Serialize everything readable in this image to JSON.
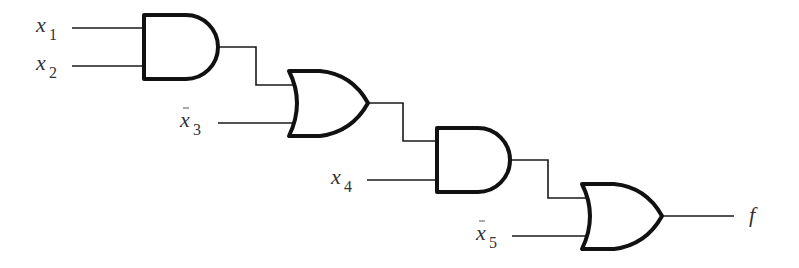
{
  "diagram": {
    "type": "logic-circuit",
    "inputs": [
      {
        "id": "x1",
        "base": "x",
        "sub": "1",
        "negated": false
      },
      {
        "id": "x2",
        "base": "x",
        "sub": "2",
        "negated": false
      },
      {
        "id": "x3",
        "base": "x",
        "sub": "3",
        "negated": true
      },
      {
        "id": "x4",
        "base": "x",
        "sub": "4",
        "negated": false
      },
      {
        "id": "x5",
        "base": "x",
        "sub": "5",
        "negated": true
      }
    ],
    "gates": [
      {
        "id": "g1",
        "type": "AND",
        "inputs": [
          "x1",
          "x2"
        ]
      },
      {
        "id": "g2",
        "type": "OR",
        "inputs": [
          "g1",
          "x3'"
        ]
      },
      {
        "id": "g3",
        "type": "AND",
        "inputs": [
          "g2",
          "x4"
        ]
      },
      {
        "id": "g4",
        "type": "OR",
        "inputs": [
          "g3",
          "x5'"
        ]
      }
    ],
    "output": {
      "label": "f",
      "source": "g4"
    }
  }
}
